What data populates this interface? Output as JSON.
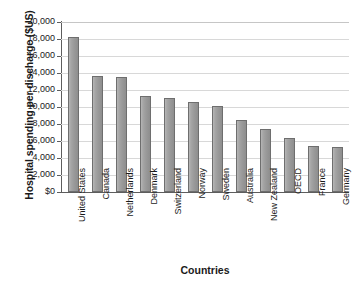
{
  "chart_data": {
    "type": "bar",
    "title": "",
    "xlabel": "Countries",
    "ylabel": "Hospital spending per discharge ($US)",
    "categories": [
      "United States",
      "Canada",
      "Netherlands",
      "Denmark",
      "Switzerland",
      "Norway",
      "Sweden",
      "Australia",
      "New Zealand",
      "OECD",
      "France",
      "Germany"
    ],
    "values": [
      18200,
      13700,
      13500,
      11300,
      11100,
      10600,
      10100,
      8500,
      7400,
      6400,
      5400,
      5300
    ],
    "ylim": [
      0,
      20000
    ],
    "ytick_values": [
      0,
      2000,
      4000,
      6000,
      8000,
      10000,
      12000,
      14000,
      16000,
      18000,
      20000
    ],
    "ytick_labels": [
      "$0",
      "2,000",
      "4,000",
      "6,000",
      "8,000",
      "10,000",
      "12,000",
      "14,000",
      "16,000",
      "18,000",
      "20,000"
    ],
    "grid": true,
    "legend": false,
    "bar_color": "#9d9d9d",
    "bar_border_color": "#6e6e6e",
    "gridline_color": "#d8d8d8",
    "axis_color": "#5d5d5d",
    "text_color": "#1a1a1a",
    "background_color": "#ffffff"
  }
}
